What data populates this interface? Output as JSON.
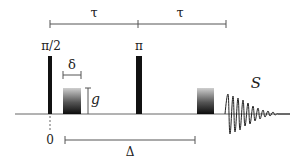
{
  "diagram": {
    "type": "pulse-sequence",
    "labels": {
      "tau_1": "τ",
      "tau_2": "τ",
      "pulse_90": "π/2",
      "pulse_180": "π",
      "delta_small": "δ",
      "gradient": "g",
      "signal": "S",
      "time_zero": "0",
      "delta_big": "Δ"
    },
    "colors": {
      "line": "#555555",
      "pulse": "#111111",
      "gradient_top": "#c8c8c8",
      "gradient_bottom": "#111111",
      "text": "#222222"
    }
  }
}
